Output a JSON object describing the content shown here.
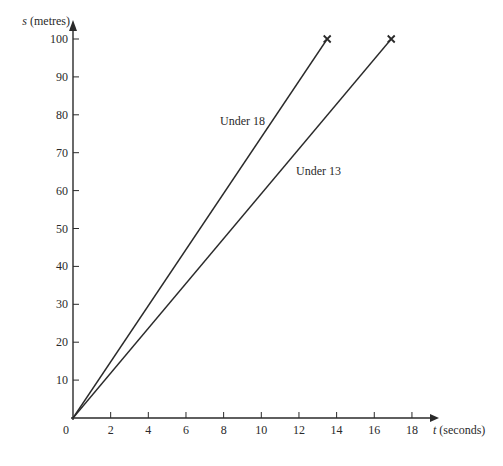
{
  "chart_data": {
    "type": "line",
    "title": "",
    "xlabel_var": "t",
    "xlabel": "t (seconds)",
    "xlabel_unit": "(seconds)",
    "ylabel_var": "s",
    "ylabel": "s (metres)",
    "ylabel_unit": "(metres)",
    "xlim": [
      0,
      19
    ],
    "ylim": [
      0,
      100
    ],
    "xticks": [
      0,
      2,
      4,
      6,
      8,
      10,
      12,
      14,
      16,
      18
    ],
    "yticks": [
      10,
      20,
      30,
      40,
      50,
      60,
      70,
      80,
      90,
      100
    ],
    "grid": false,
    "legend": "inline labels",
    "series": [
      {
        "name": "Under 18",
        "x": [
          0,
          13.5
        ],
        "y": [
          0,
          100
        ],
        "end_marker": "x"
      },
      {
        "name": "Under 13",
        "x": [
          0,
          16.9
        ],
        "y": [
          0,
          100
        ],
        "end_marker": "x"
      }
    ]
  },
  "colors": {
    "axis": "#2a2a2a",
    "line": "#2a2a2a"
  }
}
